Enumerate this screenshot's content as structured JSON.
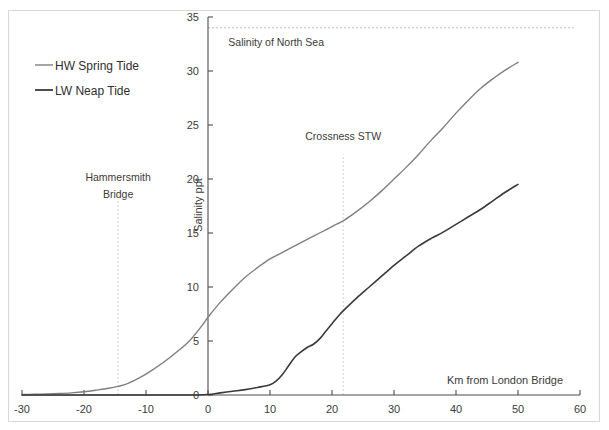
{
  "chart_data": {
    "type": "line",
    "title": "",
    "xlabel": "Km from London Bridge",
    "ylabel": "Salinity ppt",
    "xlim": [
      -30,
      60
    ],
    "ylim": [
      0,
      35
    ],
    "xticks": [
      -30,
      -20,
      -10,
      0,
      10,
      20,
      30,
      40,
      50,
      60
    ],
    "xtick_labels": [
      "-30",
      "-20",
      "-10",
      "0",
      "10",
      "20",
      "30",
      "40",
      "50",
      "60"
    ],
    "yticks": [
      0,
      5,
      10,
      15,
      20,
      25,
      30,
      35
    ],
    "ytick_labels": [
      "0",
      "5",
      "10",
      "15",
      "20",
      "25",
      "30",
      "35"
    ],
    "grid": false,
    "legend_position": "upper-left",
    "series": [
      {
        "name": "HW Spring Tide",
        "color": "#7f7f7f",
        "width": 1.4,
        "x": [
          -30,
          -28,
          -26,
          -24,
          -22,
          -20,
          -18,
          -16,
          -14.5,
          -13,
          -11,
          -9,
          -7,
          -5,
          -3,
          -1,
          0,
          2,
          4,
          6,
          8,
          10,
          12,
          14,
          16,
          18,
          20,
          22,
          24,
          26,
          28,
          30,
          32,
          34,
          36,
          38,
          40,
          42,
          44,
          46,
          48,
          50
        ],
        "y": [
          0.05,
          0.07,
          0.1,
          0.14,
          0.2,
          0.3,
          0.45,
          0.62,
          0.8,
          1.05,
          1.6,
          2.3,
          3.1,
          4.0,
          5.0,
          6.4,
          7.2,
          8.6,
          9.8,
          10.9,
          11.8,
          12.6,
          13.2,
          13.8,
          14.4,
          15.0,
          15.6,
          16.2,
          17.0,
          17.9,
          18.9,
          20.0,
          21.1,
          22.3,
          23.6,
          24.8,
          26.1,
          27.3,
          28.4,
          29.3,
          30.1,
          30.8
        ]
      },
      {
        "name": "LW Neap Tide",
        "color": "#3a3a3a",
        "width": 1.6,
        "x": [
          -30,
          -20,
          -12,
          -6,
          -2,
          0,
          2,
          4,
          6,
          8,
          10,
          11,
          12,
          13,
          14,
          15,
          16,
          17,
          18,
          19,
          20,
          21,
          22,
          24,
          26,
          28,
          30,
          32,
          34,
          36,
          38,
          40,
          42,
          44,
          46,
          48,
          50
        ],
        "y": [
          0.0,
          0.0,
          0.0,
          0.0,
          0.0,
          0.05,
          0.2,
          0.35,
          0.5,
          0.7,
          0.95,
          1.3,
          1.9,
          2.7,
          3.5,
          4.0,
          4.4,
          4.7,
          5.2,
          5.9,
          6.6,
          7.3,
          7.9,
          9.0,
          10.0,
          11.0,
          12.0,
          12.9,
          13.8,
          14.5,
          15.1,
          15.8,
          16.5,
          17.2,
          18.0,
          18.8,
          19.5
        ]
      }
    ],
    "reference_lines": [
      {
        "name": "salinity-of-north-sea",
        "label": "Salinity of North Sea",
        "orientation": "horizontal",
        "value": 34,
        "x_start": 0,
        "x_end": 59,
        "color": "#bcbcbc",
        "dash": "2,2",
        "label_x": 11,
        "label_y": 32.3
      },
      {
        "name": "hammersmith-bridge",
        "label_line1": "Hammersmith",
        "label_line2": "Bridge",
        "orientation": "vertical",
        "value": -14.5,
        "y_start": 0,
        "y_end": 18.0,
        "color": "#cdcdcd",
        "dash": "2,2",
        "label_x": -14.5,
        "label_y1": 19.8,
        "label_y2": 18.2
      },
      {
        "name": "crossness-stw",
        "label": "Crossness STW",
        "orientation": "vertical",
        "value": 21.8,
        "y_start": 0,
        "y_end": 22.3,
        "color": "#d4d4d4",
        "dash": "2,2",
        "label_x": 21.8,
        "label_y": 23.6
      }
    ],
    "legend": [
      {
        "label": "HW Spring Tide",
        "color": "#7f7f7f",
        "width": 1.4
      },
      {
        "label": "LW Neap Tide",
        "color": "#3a3a3a",
        "width": 1.8
      }
    ]
  }
}
